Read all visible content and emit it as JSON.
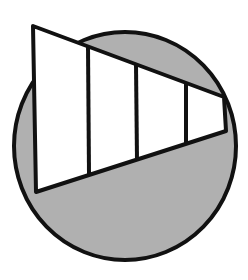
{
  "figure": {
    "width": 248,
    "height": 280,
    "background": "#ffffff",
    "stroke_color": "#111111",
    "stroke_width": 4,
    "fill_shaded": "#b0b0b0",
    "fill_unshaded": "#ffffff"
  },
  "circle": {
    "cx": 125,
    "cy": 146,
    "rx": 111,
    "ry": 114,
    "fill": "#b0b0b0"
  },
  "trapezoid": {
    "points": "33,26 224,97 226,131 36,192",
    "fill": "#ffffff",
    "sections": 4
  },
  "dividers": [
    {
      "x1": 88,
      "y1": 47,
      "x2": 89,
      "y2": 174
    },
    {
      "x1": 136,
      "y1": 65,
      "x2": 137,
      "y2": 160
    },
    {
      "x1": 186,
      "y1": 83,
      "x2": 186,
      "y2": 145
    }
  ]
}
